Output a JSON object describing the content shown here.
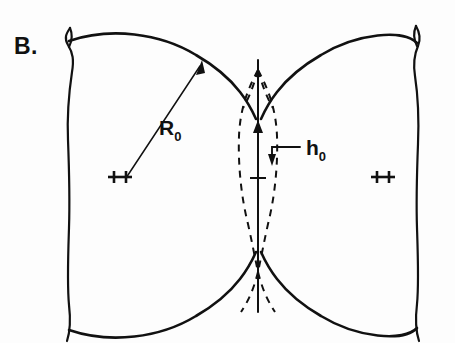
{
  "figure": {
    "panel_label": "B.",
    "labels": {
      "radius": {
        "symbol": "R",
        "subscript": "0"
      },
      "gap": {
        "symbol": "h",
        "subscript": "0"
      }
    },
    "center_markers": {
      "left": "++",
      "right": "++"
    },
    "colors": {
      "ink": "#111111",
      "background": "#fdfdfd"
    }
  }
}
